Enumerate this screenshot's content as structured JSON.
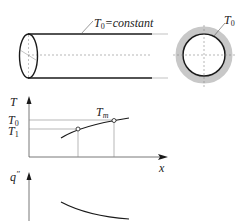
{
  "tube": {
    "label": "T",
    "label_sub": "0",
    "label_suffix": "=constant"
  },
  "cross_section": {
    "label": "T",
    "label_sub": "0",
    "ring_color": "#c8c8c8"
  },
  "temperature_plot": {
    "y_axis_label": "T",
    "t0_label": "T",
    "t0_sub": "0",
    "t1_label": "T",
    "t1_sub": "1",
    "curve_label": "T",
    "curve_sub": "m",
    "x_axis_label": "x"
  },
  "flux_plot": {
    "y_axis_label": "q",
    "y_axis_prime": "″"
  },
  "colors": {
    "line": "#1a1a1a",
    "guide": "#888888",
    "ring": "#c8c8c8"
  }
}
